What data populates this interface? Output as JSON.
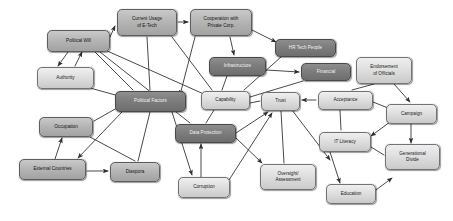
{
  "diagram": {
    "type": "concept-map",
    "background_color": "#ffffff",
    "node_fill_light": "#dedede",
    "node_fill_mid": "#b4b4b4",
    "node_fill_dark": "#7d7d7d",
    "edge_color": "#404040",
    "nodes": [
      {
        "id": "political_will",
        "label": "Political Will",
        "x": 47,
        "y": 30,
        "w": 63,
        "h": 22,
        "shade": "mid"
      },
      {
        "id": "authority",
        "label": "Authority",
        "x": 37,
        "y": 67,
        "w": 57,
        "h": 22,
        "shade": "light"
      },
      {
        "id": "current_usage",
        "label": "Current Usage\nof E-Tech",
        "x": 117,
        "y": 9,
        "w": 60,
        "h": 27,
        "shade": "mid"
      },
      {
        "id": "cooperation",
        "label": "Cooperation with\nPrivate Corp.",
        "x": 190,
        "y": 9,
        "w": 62,
        "h": 27,
        "shade": "mid"
      },
      {
        "id": "hr_tech_people",
        "label": "HR Tech People",
        "x": 275,
        "y": 39,
        "w": 61,
        "h": 18,
        "shade": "dark"
      },
      {
        "id": "infrastructure",
        "label": "Infrastructure",
        "x": 209,
        "y": 57,
        "w": 57,
        "h": 19,
        "shade": "dark"
      },
      {
        "id": "financial",
        "label": "Financial",
        "x": 301,
        "y": 63,
        "w": 50,
        "h": 18,
        "shade": "dark"
      },
      {
        "id": "endorsement",
        "label": "Endorsement\nof Officials",
        "x": 356,
        "y": 57,
        "w": 56,
        "h": 27,
        "shade": "light"
      },
      {
        "id": "political_factors",
        "label": "Political Factors",
        "x": 115,
        "y": 91,
        "w": 71,
        "h": 21,
        "shade": "dark"
      },
      {
        "id": "capability",
        "label": "Capability",
        "x": 201,
        "y": 91,
        "w": 49,
        "h": 19,
        "shade": "light"
      },
      {
        "id": "trust",
        "label": "Trust",
        "x": 261,
        "y": 92,
        "w": 39,
        "h": 19,
        "shade": "light"
      },
      {
        "id": "acceptance",
        "label": "Acceptance",
        "x": 318,
        "y": 91,
        "w": 55,
        "h": 19,
        "shade": "light"
      },
      {
        "id": "campaign",
        "label": "Campaign",
        "x": 386,
        "y": 104,
        "w": 51,
        "h": 20,
        "shade": "light"
      },
      {
        "id": "occupation",
        "label": "Occupation",
        "x": 39,
        "y": 117,
        "w": 54,
        "h": 20,
        "shade": "mid"
      },
      {
        "id": "data_protection",
        "label": "Data Protection",
        "x": 175,
        "y": 124,
        "w": 61,
        "h": 19,
        "shade": "dark"
      },
      {
        "id": "it_literacy",
        "label": "IT Literacy",
        "x": 319,
        "y": 132,
        "w": 52,
        "h": 20,
        "shade": "light"
      },
      {
        "id": "generational_divide",
        "label": "Generational\nDivide",
        "x": 385,
        "y": 144,
        "w": 55,
        "h": 26,
        "shade": "light"
      },
      {
        "id": "external_countries",
        "label": "External Countries",
        "x": 19,
        "y": 159,
        "w": 67,
        "h": 21,
        "shade": "mid"
      },
      {
        "id": "diaspora",
        "label": "Diaspora",
        "x": 110,
        "y": 162,
        "w": 50,
        "h": 20,
        "shade": "mid"
      },
      {
        "id": "oversight",
        "label": "Oversight/\nAssessment",
        "x": 260,
        "y": 164,
        "w": 56,
        "h": 26,
        "shade": "light"
      },
      {
        "id": "corruption",
        "label": "Corruption",
        "x": 178,
        "y": 177,
        "w": 52,
        "h": 21,
        "shade": "light"
      },
      {
        "id": "education",
        "label": "Education",
        "x": 326,
        "y": 184,
        "w": 50,
        "h": 20,
        "shade": "light"
      }
    ],
    "edges": [
      {
        "from": "political_will",
        "to": "current_usage",
        "x1": 110,
        "y1": 37,
        "x2": 115,
        "y2": 26,
        "arrow": true
      },
      {
        "from": "political_will",
        "to": "authority",
        "x1": 68,
        "y1": 52,
        "x2": 58,
        "y2": 66,
        "arrow": true
      },
      {
        "from": "authority",
        "to": "political_will",
        "x1": 75,
        "y1": 66,
        "x2": 82,
        "y2": 52,
        "arrow": true
      },
      {
        "from": "political_will",
        "to": "political_factors",
        "x1": 95,
        "y1": 52,
        "x2": 133,
        "y2": 90,
        "arrow": false
      },
      {
        "from": "political_will",
        "to": "capability",
        "x1": 105,
        "y1": 50,
        "x2": 206,
        "y2": 95,
        "arrow": false
      },
      {
        "from": "political_will",
        "to": "data_protection",
        "x1": 100,
        "y1": 52,
        "x2": 190,
        "y2": 123,
        "arrow": false
      },
      {
        "from": "authority",
        "to": "political_factors",
        "x1": 90,
        "y1": 88,
        "x2": 130,
        "y2": 99,
        "arrow": false
      },
      {
        "from": "current_usage",
        "to": "cooperation",
        "x1": 178,
        "y1": 22,
        "x2": 188,
        "y2": 22,
        "arrow": true
      },
      {
        "from": "current_usage",
        "to": "political_factors",
        "x1": 147,
        "y1": 37,
        "x2": 150,
        "y2": 90,
        "arrow": false
      },
      {
        "from": "current_usage",
        "to": "capability",
        "x1": 172,
        "y1": 37,
        "x2": 212,
        "y2": 90,
        "arrow": false
      },
      {
        "from": "cooperation",
        "to": "hr_tech_people",
        "x1": 252,
        "y1": 30,
        "x2": 276,
        "y2": 42,
        "arrow": true
      },
      {
        "from": "cooperation",
        "to": "infrastructure",
        "x1": 230,
        "y1": 37,
        "x2": 234,
        "y2": 55,
        "arrow": true
      },
      {
        "from": "cooperation",
        "to": "political_factors",
        "x1": 195,
        "y1": 37,
        "x2": 180,
        "y2": 95,
        "arrow": true
      },
      {
        "from": "hr_tech_people",
        "to": "capability",
        "x1": 281,
        "y1": 57,
        "x2": 244,
        "y2": 90,
        "arrow": false
      },
      {
        "from": "infrastructure",
        "to": "financial",
        "x1": 266,
        "y1": 70,
        "x2": 299,
        "y2": 72,
        "arrow": true
      },
      {
        "from": "infrastructure",
        "to": "capability",
        "x1": 227,
        "y1": 76,
        "x2": 222,
        "y2": 90,
        "arrow": false
      },
      {
        "from": "financial",
        "to": "capability",
        "x1": 303,
        "y1": 81,
        "x2": 250,
        "y2": 97,
        "arrow": false
      },
      {
        "from": "endorsement",
        "to": "acceptance",
        "x1": 374,
        "y1": 84,
        "x2": 352,
        "y2": 90,
        "arrow": false
      },
      {
        "from": "endorsement",
        "to": "campaign",
        "x1": 394,
        "y1": 84,
        "x2": 410,
        "y2": 102,
        "arrow": true
      },
      {
        "from": "acceptance",
        "to": "trust",
        "x1": 316,
        "y1": 100,
        "x2": 302,
        "y2": 100,
        "arrow": true
      },
      {
        "from": "acceptance",
        "to": "campaign",
        "x1": 373,
        "y1": 102,
        "x2": 388,
        "y2": 108,
        "arrow": false
      },
      {
        "from": "acceptance",
        "to": "it_literacy",
        "x1": 340,
        "y1": 110,
        "x2": 341,
        "y2": 130,
        "arrow": false
      },
      {
        "from": "campaign",
        "to": "it_literacy",
        "x1": 390,
        "y1": 122,
        "x2": 371,
        "y2": 136,
        "arrow": true
      },
      {
        "from": "campaign",
        "to": "generational_divide",
        "x1": 411,
        "y1": 124,
        "x2": 411,
        "y2": 143,
        "arrow": true
      },
      {
        "from": "it_literacy",
        "to": "generational_divide",
        "x1": 371,
        "y1": 147,
        "x2": 384,
        "y2": 155,
        "arrow": false
      },
      {
        "from": "it_literacy",
        "to": "education",
        "x1": 330,
        "y1": 152,
        "x2": 340,
        "y2": 183,
        "arrow": true
      },
      {
        "from": "education",
        "to": "it_literacy",
        "x1": 376,
        "y1": 190,
        "x2": 392,
        "y2": 178,
        "arrow": true
      },
      {
        "from": "trust",
        "to": "it_literacy",
        "x1": 292,
        "y1": 110,
        "x2": 330,
        "y2": 160,
        "arrow": true
      },
      {
        "from": "trust",
        "to": "oversight",
        "x1": 281,
        "y1": 111,
        "x2": 284,
        "y2": 163,
        "arrow": false
      },
      {
        "from": "capability",
        "to": "trust",
        "x1": 250,
        "y1": 103,
        "x2": 260,
        "y2": 101,
        "arrow": false
      },
      {
        "from": "capability",
        "to": "data_protection",
        "x1": 214,
        "y1": 110,
        "x2": 206,
        "y2": 123,
        "arrow": false
      },
      {
        "from": "data_protection",
        "to": "trust",
        "x1": 236,
        "y1": 133,
        "x2": 268,
        "y2": 112,
        "arrow": true
      },
      {
        "from": "data_protection",
        "to": "oversight",
        "x1": 236,
        "y1": 138,
        "x2": 262,
        "y2": 163,
        "arrow": true
      },
      {
        "from": "corruption",
        "to": "data_protection",
        "x1": 201,
        "y1": 177,
        "x2": 201,
        "y2": 144,
        "arrow": true
      },
      {
        "from": "corruption",
        "to": "trust",
        "x1": 229,
        "y1": 180,
        "x2": 272,
        "y2": 113,
        "arrow": true
      },
      {
        "from": "political_factors",
        "to": "corruption",
        "x1": 172,
        "y1": 112,
        "x2": 192,
        "y2": 175,
        "arrow": true
      },
      {
        "from": "political_factors",
        "to": "diaspora",
        "x1": 150,
        "y1": 112,
        "x2": 138,
        "y2": 161,
        "arrow": false
      },
      {
        "from": "political_factors",
        "to": "occupation",
        "x1": 117,
        "y1": 108,
        "x2": 94,
        "y2": 121,
        "arrow": false
      },
      {
        "from": "political_factors",
        "to": "external_countries",
        "x1": 122,
        "y1": 112,
        "x2": 78,
        "y2": 158,
        "arrow": true
      },
      {
        "from": "external_countries",
        "to": "occupation",
        "x1": 55,
        "y1": 159,
        "x2": 62,
        "y2": 138,
        "arrow": true
      },
      {
        "from": "external_countries",
        "to": "diaspora",
        "x1": 87,
        "y1": 171,
        "x2": 108,
        "y2": 171,
        "arrow": true
      },
      {
        "from": "occupation",
        "to": "diaspora",
        "x1": 90,
        "y1": 137,
        "x2": 135,
        "y2": 161,
        "arrow": false
      }
    ]
  }
}
